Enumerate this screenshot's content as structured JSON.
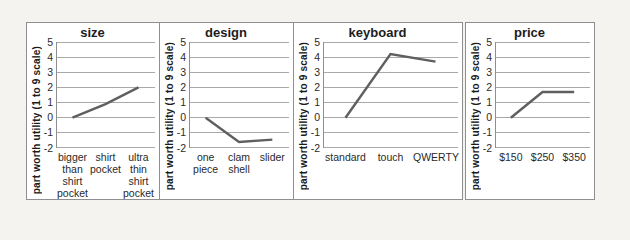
{
  "figure_title": "",
  "colors": {
    "page_bg": "#f5f3ef",
    "panel_bg": "#ffffff",
    "panel_border": "#8f8f8f",
    "line": "#5f5f5f",
    "grid": "#a9a9a9",
    "axis": "#8f8f8f",
    "text": "#1c1c1c"
  },
  "chart_data": [
    {
      "type": "line",
      "title": "size",
      "xlabel": "",
      "ylabel": "part worth utility (1 to 9 scale)",
      "ylim": [
        -2,
        5
      ],
      "yticks": [
        5,
        4,
        3,
        2,
        1,
        0,
        -1,
        -2
      ],
      "grid": "horizontal",
      "legend": "none",
      "categories": [
        "bigger than shirt pocket",
        "shirt pocket",
        "ultra thin shirt pocket"
      ],
      "values": [
        0,
        0.9,
        2
      ]
    },
    {
      "type": "line",
      "title": "design",
      "xlabel": "",
      "ylabel": "part worth utility (1 to 9 scale)",
      "ylim": [
        -2,
        5
      ],
      "yticks": [
        5,
        4,
        3,
        2,
        1,
        0,
        -1,
        -2
      ],
      "grid": "horizontal",
      "legend": "none",
      "categories": [
        "one piece",
        "clam shell",
        "slider"
      ],
      "values": [
        0,
        -1.6,
        -1.45
      ]
    },
    {
      "type": "line",
      "title": "keyboard",
      "xlabel": "",
      "ylabel": "part worth utility (1 to 9 scale)",
      "ylim": [
        -2,
        5
      ],
      "yticks": [
        5,
        4,
        3,
        2,
        1,
        0,
        -1,
        -2
      ],
      "grid": "horizontal",
      "legend": "none",
      "categories": [
        "standard",
        "touch",
        "QWERTY"
      ],
      "values": [
        0,
        4.2,
        3.7
      ]
    },
    {
      "type": "line",
      "title": "price",
      "xlabel": "",
      "ylabel": "part worth utility (1 to 9 scale)",
      "ylim": [
        -2,
        5
      ],
      "yticks": [
        5,
        4,
        3,
        2,
        1,
        0,
        -1,
        -2
      ],
      "grid": "horizontal",
      "legend": "none",
      "categories": [
        "$150",
        "$250",
        "$350"
      ],
      "values": [
        0,
        1.7,
        1.7
      ]
    }
  ]
}
